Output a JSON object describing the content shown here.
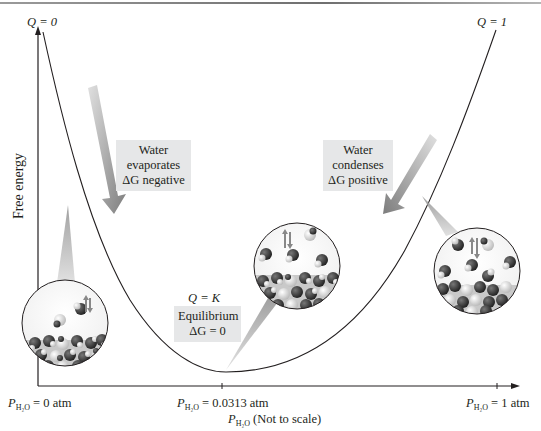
{
  "diagram": {
    "y_axis_label": "Free energy",
    "x_axis_label_var": "P",
    "x_axis_label_sub": "H₂O",
    "x_axis_label_suffix": "(Not to scale)",
    "curve_labels": {
      "left_top": "Q = 0",
      "right_top": "Q = 1",
      "minimum": "Q = K"
    },
    "x_ticks": [
      {
        "var": "P",
        "sub": "H₂O",
        "value": "= 0 atm"
      },
      {
        "var": "P",
        "sub": "H₂O",
        "value": "= 0.0313 atm"
      },
      {
        "var": "P",
        "sub": "H₂O",
        "value": "= 1 atm"
      }
    ],
    "callouts": {
      "evaporates": {
        "line1": "Water",
        "line2": "evaporates",
        "line3": "ΔG negative"
      },
      "condenses": {
        "line1": "Water",
        "line2": "condenses",
        "line3": "ΔG positive"
      },
      "equilibrium": {
        "line1": "Equilibrium",
        "line2": "ΔG = 0"
      }
    },
    "insets": [
      {
        "name": "low-pressure-inset",
        "description": "few vapor molecules, net evaporation"
      },
      {
        "name": "equilibrium-inset",
        "description": "vapor and liquid at equilibrium"
      },
      {
        "name": "high-pressure-inset",
        "description": "many vapor molecules, net condensation"
      }
    ],
    "colors": {
      "curve": "#231f20",
      "box_bg": "#e6e7e8",
      "arrow_gray": "#8a8a8a",
      "molecule_dark": "#2b2b2b",
      "molecule_light": "#eaeaea"
    }
  }
}
